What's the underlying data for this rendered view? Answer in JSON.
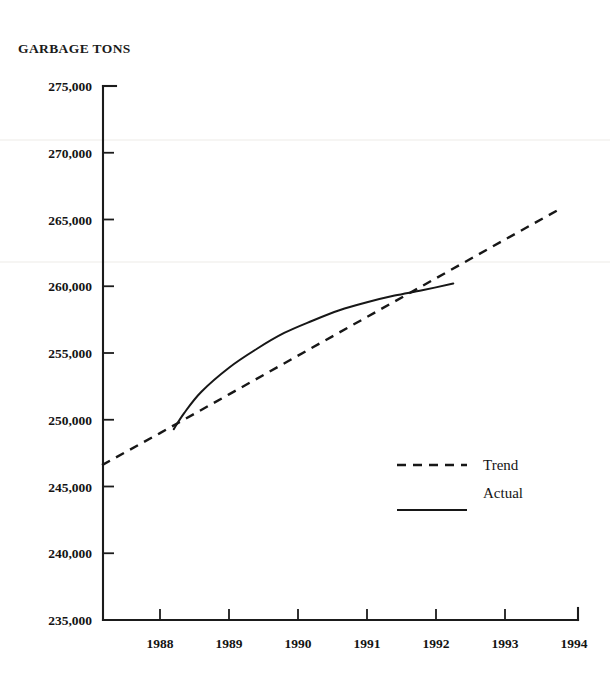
{
  "chart_data": {
    "type": "line",
    "title": "GARBAGE TONS",
    "xlabel": "",
    "ylabel": "GARBAGE TONS",
    "xlim": [
      1987.16,
      1994.3
    ],
    "ylim": [
      235000,
      275000
    ],
    "grid": false,
    "legend_position": "center-right",
    "y_ticks": [
      275000,
      270000,
      265000,
      260000,
      255000,
      250000,
      245000,
      240000,
      235000
    ],
    "y_tick_labels": [
      "275,000",
      "270,000",
      "265,000",
      "260,000",
      "255,000",
      "250,000",
      "245,000",
      "240,000",
      "235,000"
    ],
    "x_ticks": [
      1988,
      1989,
      1990,
      1991,
      1992,
      1993,
      1994
    ],
    "x_tick_labels": [
      "1988",
      "1989",
      "1990",
      "1991",
      "1992",
      "1993",
      "1994"
    ],
    "series": [
      {
        "name": "Trend",
        "style": "dashed",
        "color": "#171717",
        "x": [
          1987.16,
          1988.0,
          1989.0,
          1990.0,
          1991.0,
          1992.0,
          1993.0,
          1993.8
        ],
        "values": [
          246600,
          249000,
          251900,
          254800,
          257700,
          260600,
          263500,
          265800
        ]
      },
      {
        "name": "Actual",
        "style": "solid",
        "color": "#171717",
        "x": [
          1988.2,
          1988.35,
          1988.6,
          1989.0,
          1989.4,
          1989.8,
          1990.2,
          1990.6,
          1991.0,
          1991.4,
          1991.8,
          1992.25
        ],
        "values": [
          249300,
          250500,
          252100,
          253900,
          255300,
          256500,
          257400,
          258200,
          258800,
          259300,
          259700,
          260200
        ]
      }
    ],
    "annotations": []
  },
  "legend": {
    "items": [
      {
        "label": "Trend",
        "style": "dashed"
      },
      {
        "label": "Actual",
        "style": "solid"
      }
    ]
  },
  "axis": {
    "y_axis_name": "y-axis",
    "x_axis_name": "x-axis"
  }
}
